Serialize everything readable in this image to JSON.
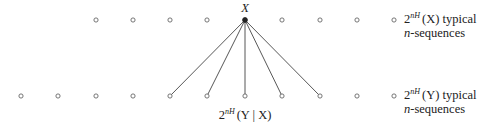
{
  "diagram": {
    "top_row": {
      "y": 20,
      "points_x": [
        96,
        133,
        170,
        207,
        245,
        282,
        320,
        357,
        394
      ],
      "highlighted_index": 4,
      "node_label": "X",
      "label": {
        "base": "2",
        "sup": "nH",
        "arg": "(X)",
        "suffix": " typical",
        "line2_ital": "n",
        "line2_rest": "-sequences"
      }
    },
    "bottom_row": {
      "y": 96,
      "points_x": [
        21,
        58,
        96,
        133,
        170,
        207,
        245,
        282,
        320,
        357,
        394
      ],
      "connected_x": [
        170,
        207,
        245,
        282,
        320
      ],
      "label": {
        "base": "2",
        "sup": "nH",
        "arg": "(Y)",
        "suffix": " typical",
        "line2_ital": "n",
        "line2_rest": "-sequences"
      },
      "fan_label": {
        "base": "2",
        "sup": "nH",
        "arg": "(Y | X)"
      }
    },
    "colors": {
      "line": "#444444",
      "circle": "#666666",
      "text": "#222222"
    }
  }
}
